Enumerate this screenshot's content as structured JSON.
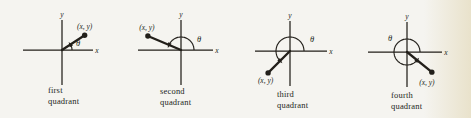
{
  "colors": {
    "ink": "#221f1a",
    "background": "#f5f4f0",
    "edge_tint": "#e9e2cb"
  },
  "labels": {
    "y_axis": "y",
    "x_axis": "x",
    "point": "(x, y)",
    "angle": "θ"
  },
  "diagrams": [
    {
      "name": "first-quadrant",
      "caption_line1": "first",
      "caption_line2": "quadrant",
      "origin": [
        62,
        50
      ],
      "y_top": 20,
      "y_bottom": 85,
      "x_left": 23,
      "x_right": 93,
      "y_label_pos": [
        62,
        17
      ],
      "x_label_pos": [
        97,
        53
      ],
      "ray_angle_deg": 33,
      "ray_length": 27,
      "arc_radius": 10,
      "arc_start_deg": 0,
      "arc_end_deg": 33,
      "theta_pos": [
        78,
        46
      ],
      "point_label_offset": [
        0,
        -6
      ]
    },
    {
      "name": "second-quadrant",
      "caption_line1": "second",
      "caption_line2": "quadrant",
      "origin": [
        181,
        50
      ],
      "y_top": 20,
      "y_bottom": 85,
      "x_left": 138,
      "x_right": 213,
      "y_label_pos": [
        181,
        17
      ],
      "x_label_pos": [
        217,
        53
      ],
      "ray_angle_deg": 157,
      "ray_length": 36,
      "arc_radius": 13,
      "arc_start_deg": 0,
      "arc_end_deg": 157,
      "theta_pos": [
        199,
        42
      ],
      "point_label_offset": [
        -1,
        -5.5
      ]
    },
    {
      "name": "third-quadrant",
      "caption_line1": "third",
      "caption_line2": "quadrant",
      "origin": [
        290,
        51
      ],
      "y_top": 21,
      "y_bottom": 86,
      "x_left": 255,
      "x_right": 327,
      "y_label_pos": [
        290,
        18
      ],
      "x_label_pos": [
        331,
        54
      ],
      "ray_angle_deg": 225,
      "ray_length": 31,
      "arc_radius": 14,
      "arc_start_deg": 0,
      "arc_end_deg": 225,
      "theta_pos": [
        312,
        42
      ],
      "point_label_offset": [
        -2.5,
        10.5
      ]
    },
    {
      "name": "fourth-quadrant",
      "caption_line1": "fourth",
      "caption_line2": "quadrant",
      "origin": [
        407,
        52
      ],
      "y_top": 22,
      "y_bottom": 87,
      "x_left": 368,
      "x_right": 442,
      "y_label_pos": [
        407,
        19
      ],
      "x_label_pos": [
        446,
        55
      ],
      "ray_angle_deg": 321,
      "ray_length": 32,
      "arc_radius": 13,
      "arc_start_deg": 0,
      "arc_end_deg": 321,
      "theta_pos": [
        390,
        41
      ],
      "point_label_offset": [
        -5,
        13
      ]
    }
  ]
}
